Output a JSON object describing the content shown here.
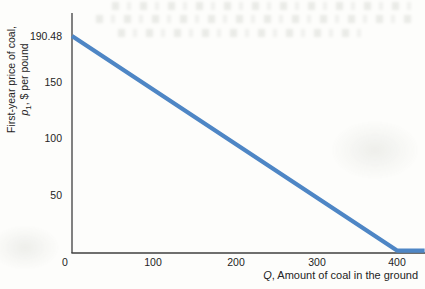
{
  "chart_data": {
    "type": "line",
    "title": "",
    "xlabel": "Q, Amount of coal in the ground",
    "ylabel": "First-year price of coal, p1, $ per pound",
    "xlim": [
      0,
      434
    ],
    "ylim": [
      0,
      211
    ],
    "grid": false,
    "legend": "none",
    "xticks": [
      0,
      100,
      200,
      300,
      400
    ],
    "yticks": [
      190.48,
      150,
      100,
      50
    ],
    "series": [
      {
        "name": "First-year price of coal",
        "color": "#4e86c5",
        "points": [
          [
            0,
            190.48
          ],
          [
            400,
            0
          ],
          [
            434,
            0
          ]
        ],
        "note": "straight demand line from p1=190.48 at Q=0 to p1=0 at Q=400, then flat along axis to right edge"
      }
    ]
  },
  "labels": {
    "ylabel_line1": "First-year price of coal,",
    "ylabel_var": "p",
    "ylabel_sub": "1",
    "ylabel_rest": ", $ per pound",
    "xlabel_var": "Q",
    "xlabel_rest": ", Amount of coal in the ground"
  },
  "colors": {
    "line": "#4e86c5",
    "axis": "#3f3f3f",
    "text": "#242424"
  }
}
